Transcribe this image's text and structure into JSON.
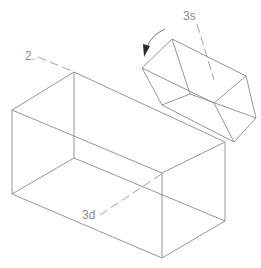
{
  "diagram": {
    "type": "isometric-wireframe",
    "colors": {
      "edge": "#8a8a8a",
      "axis": "#9a9a9a",
      "label": "#8c8c8c",
      "arrow": "#2a2a2a"
    },
    "labels": {
      "axis_2": "2.",
      "axis_3s": "3s",
      "axis_3d": "3d"
    },
    "shapes": [
      {
        "name": "large-box",
        "description": "large rectangular prism"
      },
      {
        "name": "small-box",
        "description": "smaller rotated rectangular prism on top-right corner"
      }
    ],
    "annotations": [
      {
        "name": "rotation-arrow",
        "description": "curved arrow indicating counter-clockwise rotation"
      }
    ]
  }
}
